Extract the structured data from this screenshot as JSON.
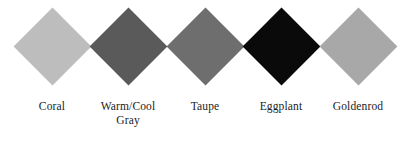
{
  "figure": {
    "type": "color-swatch-chart",
    "background_color": "#ffffff",
    "label_color": "#1c1c1c",
    "swatch_shape": "diamond"
  },
  "chart_data": {
    "type": "table",
    "title": "",
    "xlabel": "",
    "ylabel": "",
    "categories": [
      "Coral",
      "Warm/Cool\nGray",
      "Taupe",
      "Eggplant",
      "Goldenrod"
    ],
    "values": [
      "#bdbdbd",
      "#5a5a5a",
      "#6e6e6e",
      "#0a0a0a",
      "#a8a8a8"
    ],
    "series": [
      {
        "name": "swatch-color",
        "values": [
          "#bdbdbd",
          "#5a5a5a",
          "#6e6e6e",
          "#0a0a0a",
          "#a8a8a8"
        ]
      }
    ],
    "legend_position": "bottom",
    "grid": false
  },
  "swatches": [
    {
      "name": "Coral",
      "label": "Coral",
      "color": "#bdbdbd",
      "left": 11
    },
    {
      "name": "Warm/Cool Gray",
      "label": "Warm/Cool\nGray",
      "color": "#5a5a5a",
      "left": 87
    },
    {
      "name": "Taupe",
      "label": "Taupe",
      "color": "#6e6e6e",
      "left": 164
    },
    {
      "name": "Eggplant",
      "label": "Eggplant",
      "color": "#0a0a0a",
      "left": 240
    },
    {
      "name": "Goldenrod",
      "label": "Goldenrod",
      "color": "#a8a8a8",
      "left": 317
    }
  ]
}
